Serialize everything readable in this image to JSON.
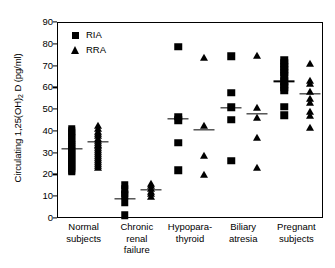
{
  "chart_data": {
    "type": "scatter",
    "title": "",
    "xlabel": "",
    "ylabel": "Circulating 1,25(OH)2D (pg/ml)",
    "ylabel_prefix": "Circulating 1,25(OH)",
    "ylabel_sub": "2",
    "ylabel_suffix": " D (pg/ml)",
    "ylim": [
      0,
      90
    ],
    "yticks": [
      0,
      10,
      20,
      30,
      40,
      50,
      60,
      70,
      80,
      90
    ],
    "ytick_labels": [
      "0",
      "10",
      "20",
      "30",
      "40",
      "50",
      "60",
      "70",
      "80",
      "90"
    ],
    "grid": false,
    "legend_position": "top-left",
    "categories": [
      "Normal\nsubjects",
      "Chronic\nrenal\nfailure",
      "Hypopara-\nthyroid",
      "Biliary\natresia",
      "Pregnant\nsubjects"
    ],
    "legend": [
      {
        "name": "RIA",
        "marker": "square"
      },
      {
        "name": "RRA",
        "marker": "triangle"
      }
    ],
    "series": [
      {
        "name": "RIA",
        "marker": "square",
        "groups": [
          {
            "category": "Normal subjects",
            "mean": 32.2,
            "values": [
              41.5,
              40.4,
              39.3,
              38.2,
              37.1,
              36.0,
              35.0,
              34.0,
              33.0,
              32.2,
              31.4,
              30.5,
              29.6,
              28.7,
              27.8,
              26.9,
              26.0,
              25.1,
              24.2,
              23.3,
              22.4,
              21.6
            ]
          },
          {
            "category": "Chronic renal failure",
            "mean": 9.2,
            "values": [
              15.6,
              13.6,
              11.7,
              10.8,
              7.7,
              1.8
            ]
          },
          {
            "category": "Hypoparathyroid",
            "mean": 45.9,
            "values": [
              79.0,
              47.0,
              45.4,
              35.0,
              22.4
            ]
          },
          {
            "category": "Biliary atresia",
            "mean": 51.0,
            "values": [
              74.8,
              58.0,
              51.2,
              45.5,
              26.7
            ]
          },
          {
            "category": "Pregnant subjects",
            "mean": 63.2,
            "values": [
              73.0,
              71.5,
              70.0,
              68.6,
              67.2,
              65.5,
              63.2,
              61.8,
              60.4,
              59.0,
              51.5,
              47.7
            ]
          }
        ]
      },
      {
        "name": "RRA",
        "marker": "triangle",
        "groups": [
          {
            "category": "Normal subjects",
            "mean": 35.5,
            "values": [
              42.6,
              41.2,
              40.0,
              38.9,
              37.9,
              36.9,
              36.0,
              35.1,
              34.2,
              33.3,
              32.4,
              31.5,
              30.6,
              29.7,
              28.8,
              27.9,
              27.0,
              26.1,
              25.2,
              24.3,
              23.4
            ]
          },
          {
            "category": "Chronic renal failure",
            "mean": 13.5,
            "values": [
              16.2,
              15.0,
              13.8,
              12.6,
              11.4,
              10.3
            ]
          },
          {
            "category": "Hypoparathyroid",
            "mean": 40.8,
            "values": [
              73.7,
              42.8,
              29.0,
              20.0
            ]
          },
          {
            "category": "Biliary atresia",
            "mean": 48.4,
            "values": [
              74.9,
              51.0,
              46.2,
              37.3,
              23.4
            ]
          },
          {
            "category": "Pregnant subjects",
            "mean": 57.6,
            "values": [
              71.3,
              63.2,
              62.0,
              58.2,
              55.3,
              53.4,
              49.3,
              47.2,
              41.6
            ]
          }
        ]
      }
    ]
  }
}
